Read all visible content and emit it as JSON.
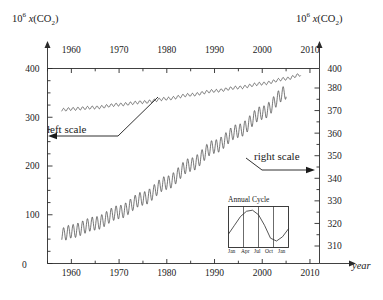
{
  "figure": {
    "left_axis_title_prefix": "10",
    "left_axis_title_exp": "6",
    "left_axis_title_var": "x",
    "left_axis_title_species": "(CO",
    "left_axis_title_species_sub": "2",
    "left_axis_title_species_end": ")",
    "right_axis_title_prefix": "10",
    "right_axis_title_exp": "6",
    "right_axis_title_var": "x",
    "right_axis_title_species": "(CO",
    "right_axis_title_species_sub": "2",
    "right_axis_title_species_end": ")",
    "x_axis_label": "year",
    "annotation_left": "left scale",
    "annotation_right": "right scale",
    "zero_label": "0"
  },
  "inset": {
    "title": "Annual Cycle",
    "month_labels": [
      "Jan",
      "Apr",
      "Jul",
      "Oct",
      "Jan"
    ]
  },
  "chart_data": {
    "type": "line",
    "title": "",
    "subtitle": "",
    "xlabel": "year",
    "ylabel_left": "10^6 x(CO2)",
    "ylabel_right": "10^6 x(CO2)",
    "grid": false,
    "legend_position": "inline-annotations",
    "x_top_ticks": [
      1960,
      1970,
      1980,
      1990,
      2000,
      2010
    ],
    "x_bottom_ticks": [
      1960,
      1970,
      1980,
      1990,
      2000,
      2010
    ],
    "xlim": [
      1955,
      2012
    ],
    "x_minor_tick_step": 5,
    "left_axis": {
      "ticks": [
        0,
        100,
        200,
        300,
        400
      ],
      "labels": [
        "0",
        "100",
        "200",
        "300",
        "400"
      ],
      "lim": [
        0,
        400
      ],
      "minor_tick_step": 25
    },
    "right_axis": {
      "ticks": [
        310,
        320,
        330,
        340,
        350,
        360,
        370,
        380,
        400
      ],
      "labels": [
        "310",
        "320",
        "330",
        "340",
        "350",
        "360",
        "370",
        "380",
        "400"
      ],
      "lim": [
        307,
        404
      ],
      "note": "400 label sits at the top frame line; spacing between 380 and 400 is compressed",
      "minor_tick_step": 5
    },
    "series": [
      {
        "name": "left scale",
        "axis": "left",
        "scale_ref": "left",
        "description": "Keeling curve plotted against the left 0-400 scale; appears as a nearly flat slowly rising band near 315-390 ppm with small annual sawtooth oscillations",
        "x_start": 1958,
        "x_end": 2008,
        "y_start": 315,
        "y_end": 387,
        "sawtooth_amplitude": 3,
        "points": [
          {
            "x": 1958,
            "y": 315
          },
          {
            "x": 1960,
            "y": 317
          },
          {
            "x": 1965,
            "y": 320
          },
          {
            "x": 1970,
            "y": 326
          },
          {
            "x": 1975,
            "y": 331
          },
          {
            "x": 1980,
            "y": 338
          },
          {
            "x": 1985,
            "y": 346
          },
          {
            "x": 1990,
            "y": 354
          },
          {
            "x": 1995,
            "y": 361
          },
          {
            "x": 2000,
            "y": 369
          },
          {
            "x": 2005,
            "y": 379
          },
          {
            "x": 2008,
            "y": 387
          }
        ]
      },
      {
        "name": "right scale",
        "axis": "right",
        "scale_ref": "right",
        "description": "Same Keeling curve plotted against the expanded right 310-400 ppm scale; large amplified annual sawtooth oscillations rising steeply",
        "x_start": 1958,
        "x_end": 2005,
        "y_start": 315,
        "y_end": 378,
        "sawtooth_amplitude": 3,
        "points": [
          {
            "x": 1958,
            "y": 315
          },
          {
            "x": 1960,
            "y": 316.5
          },
          {
            "x": 1965,
            "y": 320
          },
          {
            "x": 1970,
            "y": 325
          },
          {
            "x": 1975,
            "y": 331
          },
          {
            "x": 1980,
            "y": 338
          },
          {
            "x": 1985,
            "y": 346
          },
          {
            "x": 1990,
            "y": 354
          },
          {
            "x": 1995,
            "y": 361
          },
          {
            "x": 2000,
            "y": 369
          },
          {
            "x": 2005,
            "y": 378
          }
        ]
      }
    ],
    "inset_chart": {
      "type": "line",
      "title": "Annual Cycle",
      "x_tick_labels": [
        "Jan",
        "Apr",
        "Jul",
        "Oct",
        "Jan"
      ],
      "description": "One year of the CO2 seasonal cycle: rises from January to a May-June maximum, falls to a September-October minimum, then rises again",
      "values": [
        0.3,
        0.55,
        0.8,
        0.95,
        0.98,
        0.85,
        0.55,
        0.18,
        0.1,
        0.22,
        0.45
      ]
    }
  }
}
